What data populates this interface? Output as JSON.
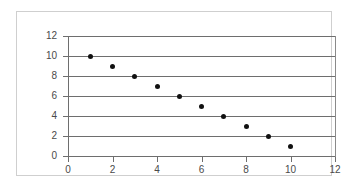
{
  "figure": {
    "has_title": false,
    "title": "",
    "frame_color": "#cfcfcf",
    "background": "#ffffff",
    "axis_color": "#6e6e6e",
    "marker_color": "#111111"
  },
  "chart_data": {
    "type": "scatter",
    "title": "",
    "subtitle": "",
    "xlabel": "",
    "ylabel": "",
    "xlim": [
      0,
      12
    ],
    "ylim": [
      0,
      12
    ],
    "xticks": [
      0,
      2,
      4,
      6,
      8,
      10,
      12
    ],
    "yticks": [
      0,
      2,
      4,
      6,
      8,
      10,
      12
    ],
    "xtick_labels": [
      "0",
      "2",
      "4",
      "6",
      "8",
      "10",
      "12"
    ],
    "ytick_labels": [
      "0",
      "2",
      "4",
      "6",
      "8",
      "10",
      "12"
    ],
    "grid": {
      "horizontal": true,
      "vertical": false,
      "color": "#6e6e6e"
    },
    "legend": {
      "visible": false,
      "position": "none",
      "entries": []
    },
    "annotations": [],
    "marker": {
      "shape": "circle",
      "size_px": 5,
      "color": "#111111"
    },
    "series": [
      {
        "name": "Series 1",
        "x": [
          1,
          2,
          3,
          4,
          5,
          6,
          7,
          8,
          9,
          10
        ],
        "y": [
          10,
          9,
          8,
          7,
          6,
          5,
          4,
          3,
          2,
          1
        ],
        "points": [
          {
            "x": 1,
            "y": 10
          },
          {
            "x": 2,
            "y": 9
          },
          {
            "x": 3,
            "y": 8
          },
          {
            "x": 4,
            "y": 7
          },
          {
            "x": 5,
            "y": 6
          },
          {
            "x": 6,
            "y": 5
          },
          {
            "x": 7,
            "y": 4
          },
          {
            "x": 8,
            "y": 3
          },
          {
            "x": 9,
            "y": 2
          },
          {
            "x": 10,
            "y": 1
          }
        ]
      }
    ]
  }
}
